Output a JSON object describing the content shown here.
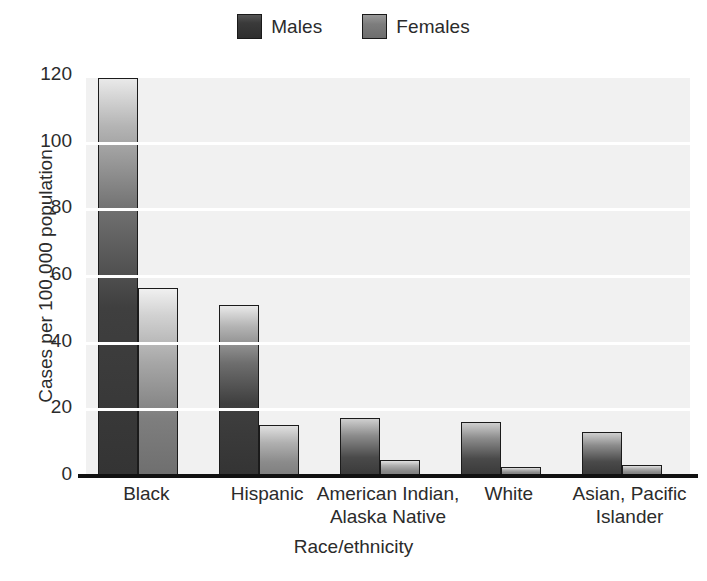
{
  "chart_data": {
    "type": "bar",
    "title": "",
    "xlabel": "Race/ethnicity",
    "ylabel": "Cases per 100,000 population",
    "categories": [
      "Black",
      "Hispanic",
      "American Indian,\nAlaska Native",
      "White",
      "Asian, Pacific\nIslander"
    ],
    "category_lines": [
      [
        "Black"
      ],
      [
        "Hispanic"
      ],
      [
        "American Indian,",
        "Alaska Native"
      ],
      [
        "White"
      ],
      [
        "Asian, Pacific",
        "Islander"
      ]
    ],
    "series": [
      {
        "name": "Males",
        "values": [
          119,
          51,
          17,
          16,
          13
        ]
      },
      {
        "name": "Females",
        "values": [
          56,
          15,
          4.5,
          2.5,
          3
        ]
      }
    ],
    "ylim": [
      0,
      120
    ],
    "yticks": [
      0,
      20,
      40,
      60,
      80,
      100,
      120
    ],
    "ytick_labels": [
      "0",
      "20",
      "40",
      "60",
      "80",
      "100",
      "120"
    ],
    "grid": true,
    "grid_color": "#ffffff",
    "plot_background": "#f1f1f1",
    "legend_position": "top-center",
    "series_colors": {
      "Males": "#3a3a3a",
      "Females": "#7d7d7d"
    }
  },
  "legend": {
    "entries": [
      {
        "label": "Males",
        "swatch": "males-swatch"
      },
      {
        "label": "Females",
        "swatch": "females-swatch"
      }
    ]
  }
}
